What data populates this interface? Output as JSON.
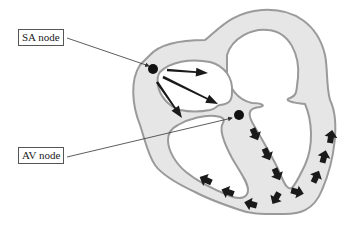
{
  "labels": {
    "sa_node": "SA node",
    "av_node": "AV node"
  },
  "colors": {
    "wall_fill": "#e6e6e6",
    "wall_stroke": "#9a9a9a",
    "arrow": "#1a1a1a",
    "node": "#111111",
    "leader_line": "#333333"
  },
  "arrows": {
    "atrial_spread_count": 3,
    "ventricular_path_count": 13
  }
}
